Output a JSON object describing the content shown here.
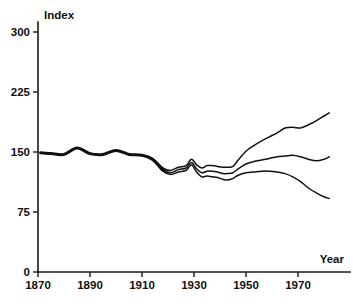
{
  "chart_data": {
    "type": "line",
    "title": "",
    "xlabel": "Year",
    "ylabel": "Index",
    "xlim": [
      1870,
      1982
    ],
    "ylim": [
      0,
      300
    ],
    "grid": false,
    "legend": "none",
    "x_ticks": [
      "1870",
      "1890",
      "1910",
      "1930",
      "1950",
      "1970"
    ],
    "x_tick_values": [
      1870,
      1890,
      1910,
      1930,
      1950,
      1970
    ],
    "y_ticks": [
      "0",
      "75",
      "150",
      "225",
      "300"
    ],
    "y_tick_values": [
      0,
      75,
      150,
      225,
      300
    ],
    "line_color": "#111111",
    "background_color": "#ffffff",
    "note": "Three index series coincide (drawn as one thick line) from 1870 to about 1918, then diverge into upper, middle and lower branches.",
    "series": [
      {
        "name": "upper",
        "x": [
          1871,
          1875,
          1880,
          1885,
          1890,
          1895,
          1900,
          1905,
          1910,
          1914,
          1918,
          1921,
          1924,
          1927,
          1929,
          1931,
          1933,
          1935,
          1937,
          1939,
          1941,
          1943,
          1945,
          1947,
          1950,
          1953,
          1956,
          1959,
          1962,
          1965,
          1968,
          1971,
          1974,
          1977,
          1980,
          1982
        ],
        "values": [
          149,
          148,
          147,
          155,
          148,
          147,
          152,
          147,
          146,
          142,
          130,
          127,
          131,
          133,
          141,
          134,
          130,
          133,
          133,
          132,
          131,
          131,
          132,
          140,
          151,
          158,
          164,
          169,
          174,
          180,
          181,
          180,
          184,
          189,
          195,
          199
        ]
      },
      {
        "name": "middle",
        "x": [
          1871,
          1875,
          1880,
          1885,
          1890,
          1895,
          1900,
          1905,
          1910,
          1914,
          1918,
          1921,
          1924,
          1927,
          1929,
          1931,
          1933,
          1935,
          1937,
          1939,
          1941,
          1943,
          1945,
          1947,
          1950,
          1953,
          1956,
          1959,
          1962,
          1965,
          1968,
          1971,
          1974,
          1977,
          1980,
          1982
        ],
        "values": [
          149,
          148,
          147,
          155,
          148,
          147,
          152,
          147,
          146,
          141,
          128,
          124,
          128,
          130,
          137,
          129,
          124,
          126,
          126,
          125,
          123,
          123,
          124,
          129,
          135,
          138,
          140,
          142,
          144,
          145,
          146,
          144,
          141,
          139,
          141,
          144
        ]
      },
      {
        "name": "lower",
        "x": [
          1871,
          1875,
          1880,
          1885,
          1890,
          1895,
          1900,
          1905,
          1910,
          1914,
          1918,
          1921,
          1924,
          1927,
          1929,
          1931,
          1933,
          1935,
          1937,
          1939,
          1941,
          1943,
          1945,
          1947,
          1950,
          1953,
          1956,
          1959,
          1962,
          1965,
          1968,
          1971,
          1974,
          1977,
          1980,
          1982
        ],
        "values": [
          149,
          148,
          147,
          155,
          148,
          147,
          152,
          147,
          146,
          140,
          126,
          122,
          125,
          127,
          134,
          125,
          119,
          120,
          119,
          118,
          116,
          115,
          117,
          121,
          124,
          125,
          126,
          126,
          125,
          123,
          119,
          113,
          105,
          99,
          94,
          92
        ]
      }
    ]
  }
}
